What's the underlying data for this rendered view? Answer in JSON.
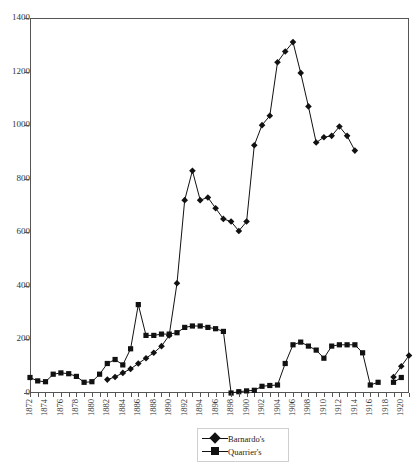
{
  "chart_data": {
    "type": "line",
    "title": "",
    "xlabel": "",
    "ylabel": "",
    "ylim": [
      0,
      1400
    ],
    "ytick_step": 200,
    "yticks": [
      0,
      200,
      400,
      600,
      800,
      1000,
      1200,
      1400
    ],
    "xlim": [
      1872,
      1921
    ],
    "xtick_labels": [
      "1872",
      "1874",
      "1876",
      "1878",
      "1880",
      "1882",
      "1884",
      "1886",
      "1888",
      "1890",
      "1892",
      "1894",
      "1896",
      "1898",
      "1900",
      "1902",
      "1904",
      "1906",
      "1908",
      "1910",
      "1912",
      "1914",
      "1916",
      "1918",
      "1920"
    ],
    "xtick_label_step": 2,
    "grid": false,
    "legend_position": "bottom-center",
    "series": [
      {
        "name": "Barnardo's",
        "marker": "diamond",
        "color": "#111111",
        "points": [
          [
            1882,
            50
          ],
          [
            1883,
            60
          ],
          [
            1884,
            75
          ],
          [
            1885,
            90
          ],
          [
            1886,
            110
          ],
          [
            1887,
            130
          ],
          [
            1888,
            150
          ],
          [
            1889,
            175
          ],
          [
            1890,
            215
          ],
          [
            1891,
            410
          ],
          [
            1892,
            720
          ],
          [
            1893,
            830
          ],
          [
            1894,
            720
          ],
          [
            1895,
            730
          ],
          [
            1896,
            690
          ],
          [
            1897,
            650
          ],
          [
            1898,
            640
          ],
          [
            1899,
            605
          ],
          [
            1900,
            640
          ],
          [
            1901,
            925
          ],
          [
            1902,
            1000
          ],
          [
            1903,
            1035
          ],
          [
            1904,
            1235
          ],
          [
            1905,
            1275
          ],
          [
            1906,
            1310
          ],
          [
            1907,
            1195
          ],
          [
            1908,
            1070
          ],
          [
            1909,
            935
          ],
          [
            1910,
            955
          ],
          [
            1911,
            960
          ],
          [
            1912,
            995
          ],
          [
            1913,
            960
          ],
          [
            1914,
            905
          ],
          [
            1919,
            60
          ],
          [
            1920,
            100
          ],
          [
            1921,
            140
          ]
        ]
      },
      {
        "name": "Quarrier's",
        "marker": "square",
        "color": "#111111",
        "points": [
          [
            1872,
            58
          ],
          [
            1873,
            45
          ],
          [
            1874,
            42
          ],
          [
            1875,
            70
          ],
          [
            1876,
            75
          ],
          [
            1877,
            72
          ],
          [
            1878,
            62
          ],
          [
            1879,
            40
          ],
          [
            1880,
            42
          ],
          [
            1881,
            70
          ],
          [
            1882,
            110
          ],
          [
            1883,
            125
          ],
          [
            1884,
            105
          ],
          [
            1885,
            165
          ],
          [
            1886,
            330
          ],
          [
            1887,
            215
          ],
          [
            1888,
            215
          ],
          [
            1889,
            220
          ],
          [
            1890,
            220
          ],
          [
            1891,
            225
          ],
          [
            1892,
            245
          ],
          [
            1893,
            250
          ],
          [
            1894,
            250
          ],
          [
            1895,
            245
          ],
          [
            1896,
            240
          ],
          [
            1897,
            230
          ],
          [
            1898,
            0
          ],
          [
            1899,
            5
          ],
          [
            1900,
            8
          ],
          [
            1901,
            10
          ],
          [
            1902,
            25
          ],
          [
            1903,
            28
          ],
          [
            1904,
            30
          ],
          [
            1905,
            110
          ],
          [
            1906,
            180
          ],
          [
            1907,
            190
          ],
          [
            1908,
            175
          ],
          [
            1909,
            160
          ],
          [
            1910,
            130
          ],
          [
            1911,
            175
          ],
          [
            1912,
            180
          ],
          [
            1913,
            180
          ],
          [
            1914,
            180
          ],
          [
            1915,
            150
          ],
          [
            1916,
            30
          ],
          [
            1917,
            40
          ],
          [
            1919,
            40
          ],
          [
            1920,
            58
          ]
        ]
      }
    ],
    "legend": [
      {
        "label": "Barnardo's",
        "marker": "diamond"
      },
      {
        "label": "Quarrier's",
        "marker": "square"
      }
    ]
  }
}
